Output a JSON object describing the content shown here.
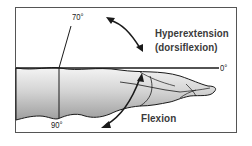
{
  "diagram": {
    "type": "wrist range of motion",
    "labels": {
      "hyperextension_line1": "Hyperextension",
      "hyperextension_line2": "(dorsiflexion)",
      "flexion": "Flexion"
    },
    "angles": {
      "top": "70°",
      "right": "0°",
      "bottom": "90°"
    },
    "colors": {
      "border": "#555555",
      "line": "#1a1a1a",
      "label": "#3a3a3a",
      "hand_fill_light": "#f2f2f2",
      "hand_fill_dark": "#b8b8b8"
    }
  }
}
